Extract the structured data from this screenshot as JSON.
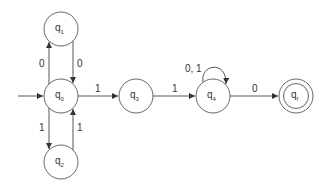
{
  "diagram": {
    "type": "finite-state-automaton",
    "start_state": "q0",
    "accept_states": [
      "qf"
    ],
    "states": [
      {
        "id": "q0",
        "base": "q",
        "sub": "0",
        "x": 61,
        "y": 96,
        "accepting": false
      },
      {
        "id": "q1",
        "base": "q",
        "sub": "1",
        "x": 61,
        "y": 29,
        "accepting": false
      },
      {
        "id": "q2",
        "base": "q",
        "sub": "2",
        "x": 61,
        "y": 162,
        "accepting": false
      },
      {
        "id": "q3",
        "base": "q",
        "sub": "3",
        "x": 136,
        "y": 96,
        "accepting": false
      },
      {
        "id": "q4",
        "base": "q",
        "sub": "4",
        "x": 213,
        "y": 96,
        "accepting": false
      },
      {
        "id": "qf",
        "base": "q",
        "sub": "f",
        "x": 296,
        "y": 96,
        "accepting": true
      }
    ],
    "transitions": [
      {
        "from": "q0",
        "to": "q1",
        "label": "0"
      },
      {
        "from": "q1",
        "to": "q0",
        "label": "0"
      },
      {
        "from": "q0",
        "to": "q2",
        "label": "1"
      },
      {
        "from": "q2",
        "to": "q0",
        "label": "1"
      },
      {
        "from": "q0",
        "to": "q3",
        "label": "1"
      },
      {
        "from": "q3",
        "to": "q4",
        "label": "1"
      },
      {
        "from": "q4",
        "to": "q4",
        "label": "0, 1"
      },
      {
        "from": "q4",
        "to": "qf",
        "label": "0"
      }
    ]
  }
}
